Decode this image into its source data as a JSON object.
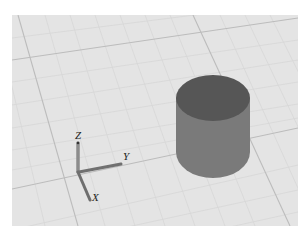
{
  "viewport": {
    "background": "#e4e4e4",
    "grid": {
      "minor_color": "#d6d6d6",
      "major_color": "#bdbdbd"
    },
    "objects": [
      {
        "type": "cylinder",
        "top_color": "#565656",
        "side_color": "#7a7a7a"
      }
    ],
    "axes_gizmo": {
      "x_label": "X",
      "y_label": "Y",
      "z_label": "Z",
      "axis_color": "#8a8a8a"
    }
  }
}
